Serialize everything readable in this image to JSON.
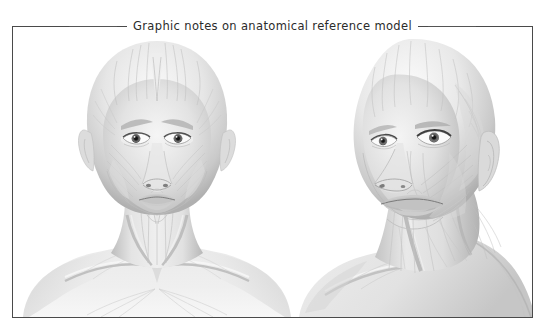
{
  "panel": {
    "title": "Graphic notes on anatomical reference model",
    "border_color": "#4a4a4a",
    "background_color": "#ffffff"
  },
  "figures": [
    {
      "id": "front",
      "name": "frontal-anatomical-head",
      "view": "frontal",
      "subject": "bald female head, neck and shoulders",
      "rendering": "grayscale pencil / graphite ecorche study",
      "alt": "Frontal view of a bald female anatomical reference model showing facial muscles, neck and clavicles",
      "visible_structures": [
        "frontalis",
        "temporalis",
        "orbicularis oculi",
        "zygomaticus major",
        "masseter",
        "orbicularis oris",
        "platysma",
        "sternocleidomastoid",
        "trapezius",
        "clavicle",
        "deltoid",
        "pectoralis major"
      ]
    },
    {
      "id": "three_quarter",
      "name": "three-quarter-anatomical-head",
      "view": "three-quarter, turned to the viewer's left",
      "subject": "bald female head, neck and shoulder",
      "rendering": "grayscale pencil / graphite ecorche study",
      "alt": "Three-quarter view of the same bald female anatomical reference model showing temporalis, masseter and neck musculature with the ear exposed",
      "visible_structures": [
        "frontalis",
        "temporalis",
        "auricle (ear)",
        "orbicularis oculi",
        "masseter",
        "risorius",
        "orbicularis oris",
        "platysma",
        "sternocleidomastoid",
        "trapezius",
        "clavicle"
      ]
    }
  ],
  "palette": {
    "ink": "#2b2b2b",
    "rule": "#555555",
    "skin_light": "#f4f4f4",
    "skin_mid": "#d8d8d8",
    "skin_shadow": "#b4b4b4",
    "skin_deep": "#8e8e8e",
    "muscle_line": "#9a9a9a"
  }
}
